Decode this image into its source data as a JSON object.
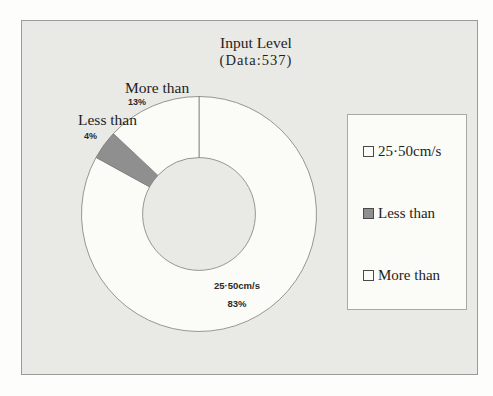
{
  "chart_data": {
    "type": "pie",
    "subtype": "donut",
    "title": "Input Level",
    "subtitle": "(Data:537)",
    "data_count": 537,
    "categories": [
      "25·50cm/s",
      "Less than",
      "More than"
    ],
    "values": [
      83,
      4,
      13
    ],
    "pct_labels": [
      "83%",
      "4%",
      "13%"
    ],
    "unit": "%",
    "colors": [
      "#fbfbf8",
      "#8f8f8f",
      "#fbfbf8"
    ],
    "outline_color": "#7d7d7a",
    "start_angle_deg": 0,
    "direction": "clockwise",
    "inner_radius_ratio": 0.48,
    "legend_position": "right",
    "background_color": "#e9e9e6"
  }
}
